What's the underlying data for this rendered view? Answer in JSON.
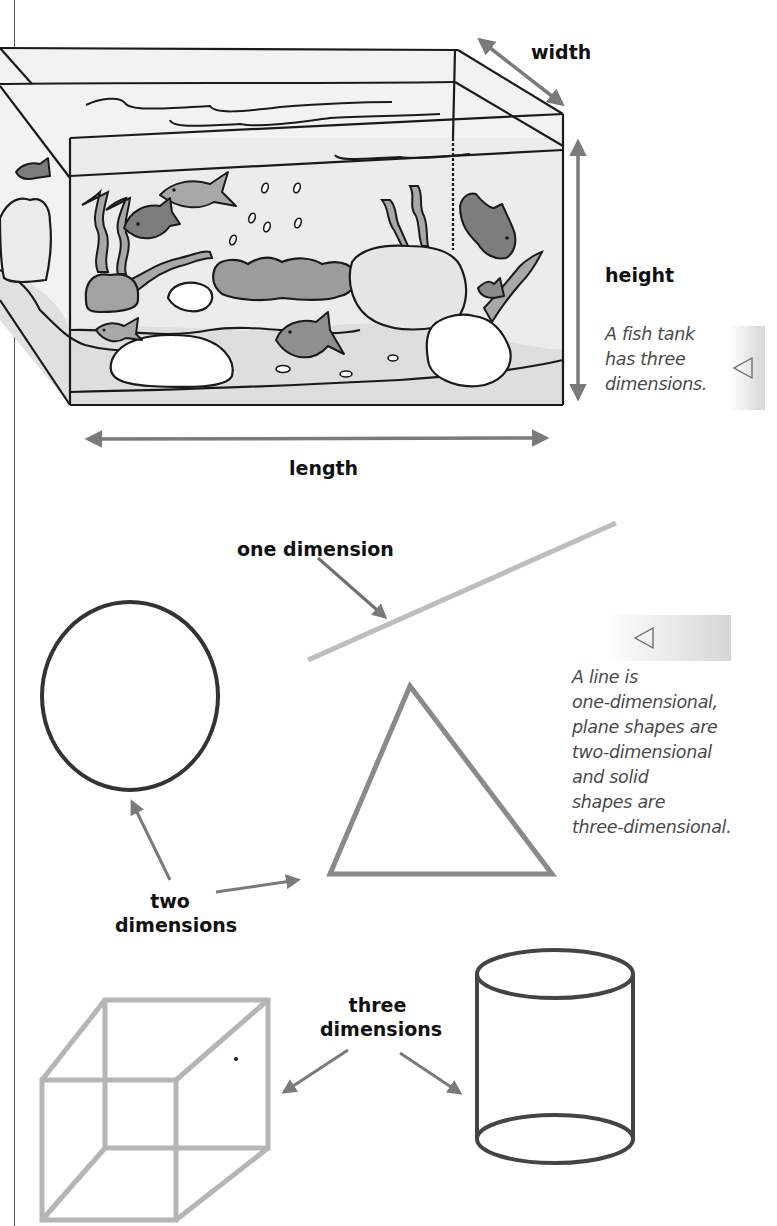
{
  "figure": {
    "tank_labels": {
      "width": "width",
      "height": "height",
      "length": "length"
    },
    "tank_caption": {
      "lines": [
        "A fish tank",
        "has three",
        "dimensions."
      ]
    },
    "dimension_labels": {
      "one": "one dimension",
      "two_line1": "two",
      "two_line2": "dimensions",
      "three_line1": "three",
      "three_line2": "dimensions"
    },
    "shapes_caption": {
      "lines": [
        "A line is",
        "one-dimensional,",
        "plane shapes are",
        "two-dimensional",
        "and solid",
        "shapes are",
        "three-dimensional."
      ]
    },
    "icons": {
      "caption_marker": "left-pointing-triangle-icon"
    },
    "colors": {
      "outline_dark": "#1a1a1a",
      "arrow_grey": "#7a7a7a",
      "line_light_grey": "#bdbdbd",
      "cube_grey": "#b5b5b5",
      "triangle_grey": "#8a8a8a",
      "circle_dark": "#333333",
      "cylinder_dark": "#444444",
      "fish_dark": "#7d7d7d",
      "fish_mid": "#a5a5a5",
      "water": "#ededed",
      "sand": "#e2e2e2"
    }
  }
}
